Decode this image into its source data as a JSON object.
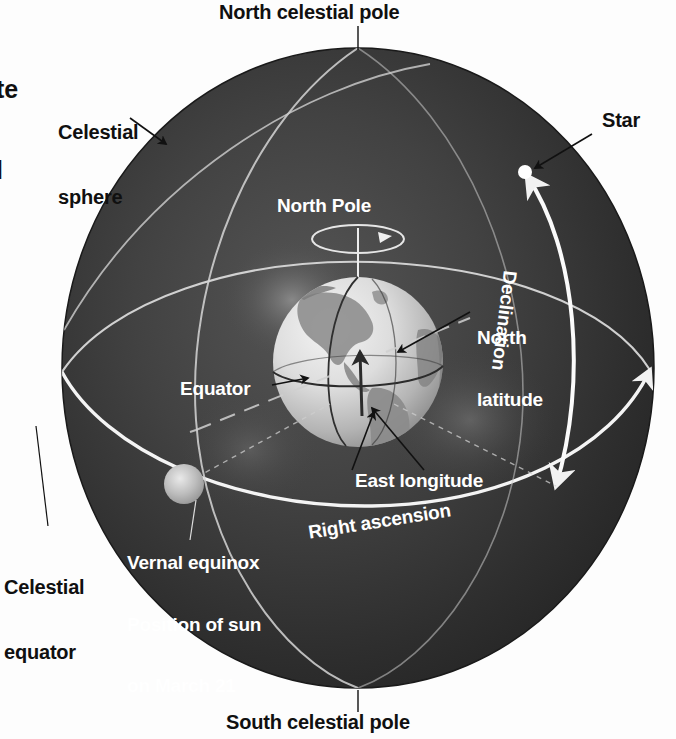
{
  "figure": {
    "background_color": "#fdfdfd",
    "sphere_color_outer": "#2b2b2b",
    "sphere_color_inner": "#4a4a4a",
    "line_color": "#e8e8e8",
    "earth_color": "#dcdcdc",
    "label_dark_color": "#101010",
    "label_light_color": "#ffffff"
  },
  "labels": {
    "clipped_top_left_line1": "te",
    "clipped_top_left_line2": "l",
    "north_celestial_pole": "North celestial pole",
    "celestial_sphere_line1": "Celestial",
    "celestial_sphere_line2": "sphere",
    "star": "Star",
    "north_pole": "North Pole",
    "north_latitude_line1": "North",
    "north_latitude_line2": "latitude",
    "declination": "Declination",
    "equator": "Equator",
    "east_longitude": "East longitude",
    "vernal_equinox_line1": "Vernal equinox",
    "vernal_equinox_line2": "Position of sun",
    "vernal_equinox_line3": "on March 21",
    "right_ascension": "Right ascension",
    "celestial_equator_line1": "Celestial",
    "celestial_equator_line2": "equator",
    "south_celestial_pole": "South celestial pole"
  },
  "geometry": {
    "sphere_center_x": 358,
    "sphere_center_y": 368,
    "sphere_radius_x": 296,
    "sphere_radius_y": 320,
    "earth_center_x": 358,
    "earth_center_y": 362,
    "earth_radius": 85,
    "star_x": 525,
    "star_y": 172,
    "sun_x": 184,
    "sun_y": 484
  }
}
